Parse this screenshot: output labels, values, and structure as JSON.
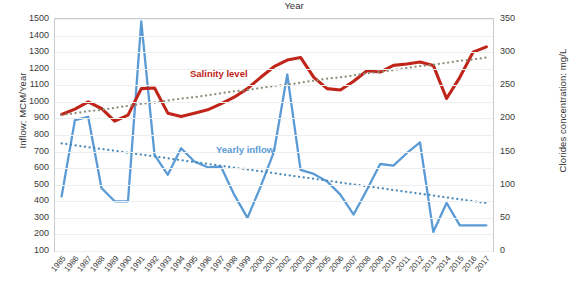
{
  "axes": {
    "left_title": "Inflow: MCM/Year",
    "right_title": "Clorides concentration: mg/L",
    "x_title": "Year",
    "left_ticks": [
      "1500",
      "1400",
      "1300",
      "1200",
      "1100",
      "1000",
      "900",
      "800",
      "700",
      "600",
      "500",
      "400",
      "300",
      "200",
      "100"
    ],
    "right_ticks": [
      "350",
      "300",
      "250",
      "200",
      "150",
      "100",
      "50",
      "0"
    ]
  },
  "labels": {
    "salinity": "Salinity level",
    "inflow": "Yearly inflow"
  },
  "chart_data": {
    "type": "line",
    "title": "",
    "xlabel": "Year",
    "ylabel": "Inflow: MCM/Year",
    "y2label": "Clorides concentration: mg/L",
    "ylim": [
      100,
      1500
    ],
    "y2lim": [
      0,
      350
    ],
    "grid": true,
    "legend": "inline-annotations",
    "categories": [
      1985,
      1986,
      1987,
      1988,
      1989,
      1990,
      1991,
      1992,
      1993,
      1994,
      1995,
      1996,
      1997,
      1998,
      1999,
      2000,
      2001,
      2002,
      2003,
      2004,
      2005,
      2006,
      2007,
      2008,
      2009,
      2010,
      2011,
      2012,
      2013,
      2014,
      2015,
      2016,
      2017
    ],
    "series": [
      {
        "name": "Yearly inflow",
        "axis": "left",
        "unit": "MCM/Year",
        "color": "#5B9BD5",
        "style": "solid",
        "values": [
          430,
          890,
          910,
          480,
          400,
          400,
          1485,
          680,
          560,
          720,
          640,
          605,
          610,
          440,
          300,
          490,
          700,
          1165,
          590,
          565,
          520,
          440,
          320,
          470,
          625,
          615,
          690,
          755,
          215,
          390,
          255,
          255,
          255
        ]
      },
      {
        "name": "Yearly inflow trend",
        "axis": "left",
        "color": "#4A89B8",
        "style": "dotted",
        "values": [
          750,
          738,
          727,
          716,
          705,
          693,
          682,
          671,
          660,
          648,
          637,
          626,
          615,
          603,
          592,
          581,
          570,
          558,
          547,
          536,
          525,
          513,
          502,
          491,
          480,
          468,
          457,
          446,
          435,
          423,
          412,
          401,
          390
        ]
      },
      {
        "name": "Salinity level",
        "axis": "right",
        "unit": "mg/L",
        "color": "#C0251A",
        "style": "solid",
        "values": [
          206,
          214,
          225,
          215,
          196,
          205,
          245,
          246,
          208,
          203,
          208,
          213,
          222,
          232,
          245,
          262,
          278,
          288,
          292,
          262,
          245,
          243,
          256,
          272,
          270,
          280,
          282,
          285,
          280,
          230,
          262,
          300,
          308
        ]
      },
      {
        "name": "Salinity level trend",
        "axis": "right",
        "color": "#8C8C78",
        "style": "dotted",
        "values": [
          205,
          208,
          211,
          213,
          216,
          219,
          222,
          224,
          227,
          230,
          232,
          235,
          238,
          241,
          243,
          246,
          249,
          251,
          254,
          257,
          260,
          262,
          265,
          268,
          270,
          273,
          276,
          279,
          281,
          284,
          287,
          289,
          292
        ]
      }
    ]
  }
}
